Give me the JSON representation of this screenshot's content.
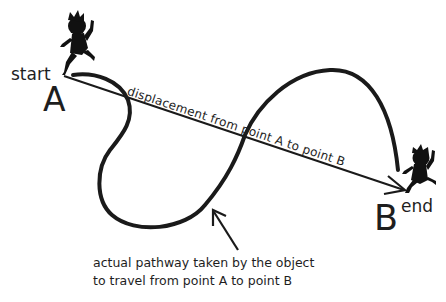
{
  "diagram": {
    "start_point": {
      "word": "start",
      "letter": "A"
    },
    "end_point": {
      "word": "end",
      "letter": "B"
    },
    "displacement_label": "displacement from point A to point B",
    "caption_lines": [
      "actual pathway taken by the object",
      "to travel from point A to point B"
    ],
    "icons": [
      "running-child-silhouette-start",
      "running-child-silhouette-end",
      "arrow-pointer"
    ],
    "colors": {
      "ink": "#1a1a1a",
      "background": "#ffffff"
    }
  }
}
